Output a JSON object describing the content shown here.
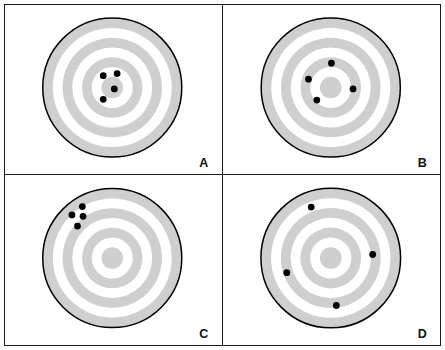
{
  "figure": {
    "title": "",
    "background_color": "#ffffff",
    "frame_color": "#1a1a1a",
    "ring_color": "#cfcfcf",
    "dot_color": "#000000",
    "target_outline_color": "#000000"
  },
  "chart_data": {
    "type": "scatter",
    "title": "",
    "xlabel": "",
    "ylabel": "",
    "grid": false,
    "legend": "none",
    "panel_layout": {
      "rows": 2,
      "cols": 2
    },
    "target_geometry": {
      "center": {
        "x": 0,
        "y": 0
      },
      "outer_radius": 1.0,
      "ring_radii": [
        1.0,
        0.855,
        0.715,
        0.575,
        0.435,
        0.295,
        0.155
      ],
      "ring_count": 7,
      "ring_fill": "#cfcfcf",
      "gap_fill": "#ffffff"
    },
    "panels": [
      {
        "label": "A",
        "position": "top-left",
        "grouping": "tight-cluster-on-center",
        "points": [
          {
            "x": -0.13,
            "y": 0.17
          },
          {
            "x": 0.07,
            "y": 0.2
          },
          {
            "x": 0.03,
            "y": -0.02
          },
          {
            "x": -0.13,
            "y": -0.17
          }
        ]
      },
      {
        "label": "B",
        "position": "top-right",
        "grouping": "spread-around-center",
        "points": [
          {
            "x": 0.01,
            "y": 0.35
          },
          {
            "x": -0.32,
            "y": 0.12
          },
          {
            "x": -0.2,
            "y": -0.18
          },
          {
            "x": 0.32,
            "y": -0.02
          }
        ]
      },
      {
        "label": "C",
        "position": "bottom-left",
        "grouping": "tight-cluster-off-center",
        "points": [
          {
            "x": -0.43,
            "y": 0.74
          },
          {
            "x": -0.58,
            "y": 0.62
          },
          {
            "x": -0.42,
            "y": 0.6
          },
          {
            "x": -0.5,
            "y": 0.46
          }
        ]
      },
      {
        "label": "D",
        "position": "bottom-right",
        "grouping": "wide-scatter",
        "points": [
          {
            "x": -0.28,
            "y": 0.73
          },
          {
            "x": 0.6,
            "y": 0.05
          },
          {
            "x": -0.63,
            "y": -0.21
          },
          {
            "x": 0.08,
            "y": -0.68
          }
        ]
      }
    ]
  },
  "panels": {
    "a": {
      "label": "A"
    },
    "b": {
      "label": "B"
    },
    "c": {
      "label": "C"
    },
    "d": {
      "label": "D"
    }
  }
}
